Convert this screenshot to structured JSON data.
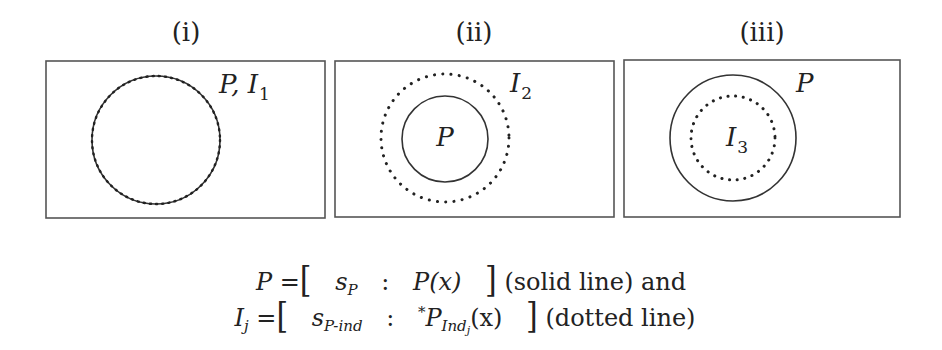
{
  "panels": [
    {
      "caption": "(i)",
      "label_main": "P, I",
      "label_sub": "1",
      "circles": [
        {
          "role": "P",
          "style": "solid",
          "cx": 156,
          "cy": 140,
          "r": 64
        },
        {
          "role": "I1",
          "style": "dotted",
          "cx": 156,
          "cy": 140,
          "r": 64
        }
      ]
    },
    {
      "caption": "(ii)",
      "outer_label_main": "I",
      "outer_label_sub": "2",
      "inner_label": "P",
      "circles": [
        {
          "role": "I2",
          "style": "dotted",
          "cx": 445,
          "cy": 138,
          "r": 64
        },
        {
          "role": "P",
          "style": "solid",
          "cx": 445,
          "cy": 139,
          "r": 43
        }
      ]
    },
    {
      "caption": "(iii)",
      "outer_label": "P",
      "inner_label_main": "I",
      "inner_label_sub": "3",
      "circles": [
        {
          "role": "P",
          "style": "solid",
          "cx": 733,
          "cy": 138,
          "r": 63
        },
        {
          "role": "I3",
          "style": "dotted",
          "cx": 733,
          "cy": 138,
          "r": 42
        }
      ]
    }
  ],
  "legend": {
    "line1": {
      "lhs": "P",
      "equals": "=",
      "open": "[",
      "s": "s",
      "s_sub": "P",
      "colon": ":",
      "fn": "P(x)",
      "close": "]",
      "note": "(solid line) and"
    },
    "line2": {
      "lhs": "I",
      "lhs_sub": "j",
      "equals": "=",
      "open": "[",
      "s": "s",
      "s_sub": "P-ind",
      "colon": ":",
      "star": "*",
      "fn": "P",
      "fn_sub": "Ind",
      "fn_subsub": "j",
      "fn_arg": "(x)",
      "close": "]",
      "note": "(dotted line)"
    }
  }
}
